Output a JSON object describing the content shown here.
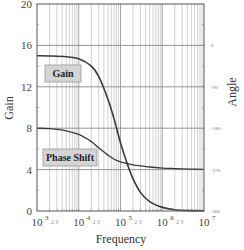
{
  "chart_data": {
    "type": "line",
    "title": "",
    "xlabel": "Frequency",
    "ylabel": "Gain",
    "y2label": "Angle",
    "xscale": "log",
    "xlim": [
      1000,
      10000000
    ],
    "ylim": [
      0,
      20
    ],
    "y2lim": [
      -360,
      0
    ],
    "grid": true,
    "x_tick_labels": [
      {
        "base": "10",
        "exp": "3",
        "minor": "2 3"
      },
      {
        "base": "10",
        "exp": "4",
        "minor": "2 3"
      },
      {
        "base": "10",
        "exp": "5",
        "minor": "2 3"
      },
      {
        "base": "10",
        "exp": "6",
        "minor": "2 3"
      },
      {
        "base": "10",
        "exp": "7",
        "minor": ""
      }
    ],
    "y_ticks": [
      0,
      4,
      8,
      12,
      16,
      20
    ],
    "y2_ticks": [
      {
        "label": "0",
        "y": 16
      },
      {
        "label": "-90",
        "y": 12
      },
      {
        "label": "-180",
        "y": 8
      },
      {
        "label": "-270",
        "y": 4
      },
      {
        "label": "-360",
        "y": 0
      }
    ],
    "series": [
      {
        "name": "Gain",
        "axis": "left",
        "color": "#3a3a3a",
        "x": [
          1000,
          2000,
          5000,
          10000,
          20000,
          30000,
          50000,
          70000,
          100000,
          150000,
          200000,
          300000,
          500000,
          1000000,
          2000000,
          5000000,
          10000000
        ],
        "y": [
          15.0,
          14.98,
          14.9,
          14.7,
          14.0,
          13.0,
          10.8,
          8.9,
          6.6,
          4.4,
          3.1,
          1.8,
          0.9,
          0.35,
          0.12,
          0.04,
          0.02
        ]
      },
      {
        "name": "Phase Shift",
        "axis": "right",
        "color": "#3a3a3a",
        "x": [
          1000,
          2000,
          5000,
          10000,
          20000,
          30000,
          50000,
          70000,
          100000,
          200000,
          500000,
          1000000,
          2000000,
          5000000,
          10000000
        ],
        "y": [
          8.0,
          7.95,
          7.75,
          7.4,
          6.7,
          6.1,
          5.4,
          5.0,
          4.75,
          4.45,
          4.25,
          4.15,
          4.1,
          4.05,
          4.02
        ]
      }
    ],
    "annotations": [
      {
        "text": "Gain",
        "near": "gain-curve"
      },
      {
        "text": "Phase Shift",
        "near": "phase-curve"
      }
    ]
  }
}
